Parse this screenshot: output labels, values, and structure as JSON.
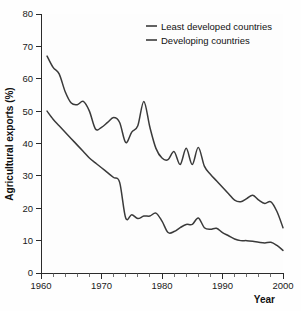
{
  "chart_data": {
    "type": "line",
    "title": "",
    "xlabel": "Year",
    "ylabel": "Agricultural exports (%)",
    "xlim": [
      1960,
      2000
    ],
    "ylim": [
      0,
      80
    ],
    "xticks": [
      1960,
      1970,
      1980,
      1990,
      2000
    ],
    "xticklabels": [
      "1960",
      "1970",
      "1980",
      "1990",
      "2000"
    ],
    "xminor_step": 2,
    "yticks": [
      0,
      10,
      20,
      30,
      40,
      50,
      60,
      70,
      80
    ],
    "yticklabels": [
      "0",
      "10",
      "20",
      "30",
      "40",
      "50",
      "60",
      "70",
      "80"
    ],
    "grid": false,
    "legend_position": "top-right",
    "series": [
      {
        "name": "Least developed countries",
        "color": "#3a3a3a",
        "x": [
          1961,
          1962,
          1963,
          1964,
          1965,
          1966,
          1967,
          1968,
          1969,
          1970,
          1971,
          1972,
          1973,
          1974,
          1975,
          1976,
          1977,
          1978,
          1979,
          1980,
          1981,
          1982,
          1983,
          1984,
          1985,
          1986,
          1987,
          1988,
          1989,
          1990,
          1991,
          1992,
          1993,
          1994,
          1995,
          1996,
          1997,
          1998,
          1999,
          2000
        ],
        "values": [
          67.0,
          63.5,
          61.5,
          56.0,
          52.5,
          52.0,
          53.0,
          50.0,
          44.5,
          45.0,
          46.5,
          48.0,
          46.5,
          40.3,
          43.5,
          45.5,
          53.0,
          45.0,
          38.5,
          35.5,
          35.0,
          37.5,
          33.5,
          38.5,
          33.5,
          38.8,
          33.0,
          30.5,
          28.5,
          26.5,
          24.5,
          22.5,
          22.0,
          23.0,
          24.0,
          22.5,
          21.5,
          22.0,
          19.0,
          14.0
        ]
      },
      {
        "name": "Developing countries",
        "color": "#3a3a3a",
        "x": [
          1961,
          1962,
          1963,
          1964,
          1965,
          1966,
          1967,
          1968,
          1969,
          1970,
          1971,
          1972,
          1973,
          1974,
          1975,
          1976,
          1977,
          1978,
          1979,
          1980,
          1981,
          1982,
          1983,
          1984,
          1985,
          1986,
          1987,
          1988,
          1989,
          1990,
          1991,
          1992,
          1993,
          1994,
          1995,
          1996,
          1997,
          1998,
          1999,
          2000
        ],
        "values": [
          50.0,
          47.5,
          45.5,
          43.5,
          41.5,
          39.5,
          37.5,
          35.5,
          34.0,
          32.5,
          31.0,
          29.5,
          28.0,
          17.0,
          18.0,
          16.8,
          17.6,
          17.6,
          18.5,
          16.0,
          12.5,
          12.8,
          14.0,
          15.0,
          15.0,
          17.0,
          14.0,
          13.5,
          13.8,
          12.5,
          11.5,
          10.5,
          10.0,
          10.0,
          9.8,
          9.5,
          9.3,
          9.5,
          8.5,
          7.0
        ]
      }
    ],
    "legend_entries": [
      {
        "label": "Least developed countries"
      },
      {
        "label": "Developing countries"
      }
    ]
  },
  "colors": {
    "line": "#3a3a3a",
    "axis": "#2b2b2b",
    "background": "#fefefe",
    "text": "#111111"
  }
}
